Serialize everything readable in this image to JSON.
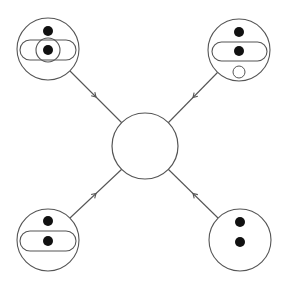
{
  "diagram": {
    "type": "feynman-like merger diagram",
    "stroke_color": "#555555",
    "fill_color": "#111111",
    "background": "#ffffff",
    "center_node": {
      "cx": 145,
      "cy": 146,
      "r": 33
    },
    "outer_nodes": [
      {
        "id": "top-left",
        "cx": 48,
        "cy": 49,
        "r": 31,
        "dots": [
          {
            "cx": 48,
            "cy": 31,
            "r": 5
          },
          {
            "cx": 48,
            "cy": 50,
            "r": 5
          }
        ],
        "pill": {
          "x": 20,
          "y": 40,
          "w": 56,
          "h": 20
        },
        "ring": {
          "cx": 48,
          "cy": 50,
          "r": 12
        },
        "hollow_dot": null
      },
      {
        "id": "top-right",
        "cx": 239,
        "cy": 50,
        "r": 31,
        "dots": [
          {
            "cx": 239,
            "cy": 32,
            "r": 5
          },
          {
            "cx": 239,
            "cy": 51,
            "r": 5
          }
        ],
        "pill": {
          "x": 212,
          "y": 42,
          "w": 55,
          "h": 19
        },
        "ring": null,
        "hollow_dot": {
          "cx": 239,
          "cy": 72,
          "r": 6
        }
      },
      {
        "id": "bottom-left",
        "cx": 48,
        "cy": 240,
        "r": 31,
        "dots": [
          {
            "cx": 48,
            "cy": 221,
            "r": 5
          },
          {
            "cx": 48,
            "cy": 241,
            "r": 5
          }
        ],
        "pill": {
          "x": 20,
          "y": 231,
          "w": 56,
          "h": 20
        },
        "ring": null,
        "hollow_dot": null
      },
      {
        "id": "bottom-right",
        "cx": 240,
        "cy": 240,
        "r": 31,
        "dots": [
          {
            "cx": 240,
            "cy": 222,
            "r": 5
          },
          {
            "cx": 240,
            "cy": 242,
            "r": 5
          }
        ],
        "pill": null,
        "ring": null,
        "hollow_dot": null
      }
    ],
    "edges": [
      {
        "id": "edge-top-left",
        "x1": 70,
        "y1": 71,
        "x2": 122,
        "y2": 123,
        "arrow_at": 0.5,
        "direction": "toward-center"
      },
      {
        "id": "edge-top-right",
        "x1": 218,
        "y1": 72,
        "x2": 168,
        "y2": 123,
        "arrow_at": 0.5,
        "direction": "toward-center"
      },
      {
        "id": "edge-bottom-left",
        "x1": 70,
        "y1": 218,
        "x2": 122,
        "y2": 169,
        "arrow_at": 0.5,
        "direction": "toward-center"
      },
      {
        "id": "edge-bottom-right",
        "x1": 218,
        "y1": 218,
        "x2": 168,
        "y2": 169,
        "arrow_at": 0.5,
        "direction": "toward-center"
      }
    ]
  }
}
